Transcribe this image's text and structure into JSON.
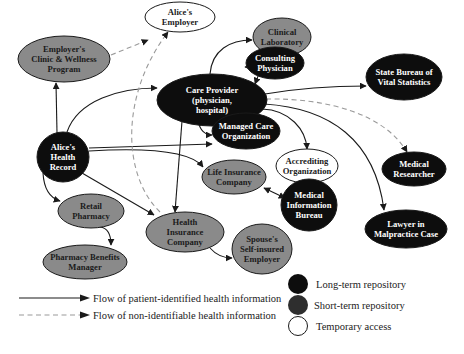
{
  "diagram": {
    "colors": {
      "long_term": "#0d0d0d",
      "short_term": "#8a8a8a",
      "legend_short_term": "#2e2e2e",
      "temporary": "#ffffff",
      "solid_edge": "#1a1a1a",
      "dashed_edge": "#9a9a9a"
    },
    "nodes": [
      {
        "id": "employers_clinic",
        "type": "short_term",
        "lines": [
          "Employer's",
          "Clinic & Wellness",
          "Program"
        ],
        "cx": 64,
        "cy": 59,
        "rx": 46,
        "ry": 23
      },
      {
        "id": "alices_employer",
        "type": "temporary",
        "lines": [
          "Alice's",
          "Employer"
        ],
        "cx": 180,
        "cy": 17,
        "rx": 35,
        "ry": 15
      },
      {
        "id": "clinical_laboratory",
        "type": "short_term",
        "lines": [
          "Clinical",
          "Laboratory"
        ],
        "cx": 282,
        "cy": 37,
        "rx": 29,
        "ry": 19
      },
      {
        "id": "care_provider",
        "type": "long_term",
        "lines": [
          "Care Provider",
          "(physician,",
          "hospital)"
        ],
        "cx": 212,
        "cy": 100,
        "rx": 55,
        "ry": 26
      },
      {
        "id": "consulting_physician",
        "type": "long_term",
        "lines": [
          "Consulting",
          "Physician"
        ],
        "cx": 275,
        "cy": 63,
        "rx": 29,
        "ry": 16
      },
      {
        "id": "state_bureau",
        "type": "long_term",
        "lines": [
          "State Bureau of",
          "Vital Statistics"
        ],
        "cx": 404,
        "cy": 77,
        "rx": 38,
        "ry": 23
      },
      {
        "id": "managed_care",
        "type": "long_term",
        "lines": [
          "Managed Care",
          "Organization"
        ],
        "cx": 246,
        "cy": 131,
        "rx": 34,
        "ry": 18
      },
      {
        "id": "alices_health_record",
        "type": "long_term",
        "lines": [
          "Alice's",
          "Health",
          "Record"
        ],
        "cx": 63,
        "cy": 157,
        "rx": 26,
        "ry": 25
      },
      {
        "id": "accrediting_org",
        "type": "temporary",
        "lines": [
          "Accrediting",
          "Organization"
        ],
        "cx": 307,
        "cy": 166,
        "rx": 31,
        "ry": 17
      },
      {
        "id": "medical_researcher",
        "type": "long_term",
        "lines": [
          "Medical",
          "Researcher"
        ],
        "cx": 414,
        "cy": 169,
        "rx": 32,
        "ry": 17
      },
      {
        "id": "life_insurance",
        "type": "short_term",
        "lines": [
          "Life Insurance",
          "Company"
        ],
        "cx": 234,
        "cy": 177,
        "rx": 32,
        "ry": 17
      },
      {
        "id": "medical_info_bureau",
        "type": "long_term",
        "lines": [
          "Medical",
          "Information",
          "Bureau"
        ],
        "cx": 309,
        "cy": 205,
        "rx": 28,
        "ry": 26
      },
      {
        "id": "lawyer",
        "type": "long_term",
        "lines": [
          "Lawyer in",
          "Malpractice Case"
        ],
        "cx": 406,
        "cy": 229,
        "rx": 41,
        "ry": 19
      },
      {
        "id": "retail_pharmacy",
        "type": "short_term",
        "lines": [
          "Retail",
          "Pharmacy"
        ],
        "cx": 91,
        "cy": 211,
        "rx": 33,
        "ry": 17
      },
      {
        "id": "health_insurance",
        "type": "short_term",
        "lines": [
          "Health",
          "Insurance",
          "Company"
        ],
        "cx": 185,
        "cy": 232,
        "rx": 39,
        "ry": 20
      },
      {
        "id": "pharmacy_benefits",
        "type": "short_term",
        "lines": [
          "Pharmacy Benefits",
          "Manager"
        ],
        "cx": 85,
        "cy": 262,
        "rx": 42,
        "ry": 17
      },
      {
        "id": "spouses_employer",
        "type": "short_term",
        "lines": [
          "Spouse's",
          "Self-insured",
          "Employer"
        ],
        "cx": 262,
        "cy": 249,
        "rx": 30,
        "ry": 25
      }
    ],
    "edges": [
      {
        "from": "alices_health_record",
        "to": "employers_clinic",
        "style": "solid",
        "d": "M 57 133 L 56 83"
      },
      {
        "from": "employers_clinic",
        "to": "alices_employer",
        "style": "dashed",
        "d": "M 111 55 L 148 40"
      },
      {
        "from": "alices_health_record",
        "to": "care_provider",
        "style": "solid",
        "d": "M 67 132 C 78 100, 120 88, 157 88"
      },
      {
        "from": "care_provider",
        "to": "clinical_laboratory",
        "style": "solid",
        "d": "M 210 74 C 212 50, 230 40, 252 40"
      },
      {
        "from": "care_provider",
        "to": "consulting_physician",
        "style": "both",
        "d": "M 255 84 C 260 70, 265 67, 245 67"
      },
      {
        "from": "care_provider",
        "to": "state_bureau",
        "style": "solid",
        "d": "M 265 94 C 300 88, 340 86, 366 86"
      },
      {
        "from": "care_provider",
        "to": "managed_care",
        "style": "both",
        "d": "M 197 113 C 198 130, 205 135, 212 135"
      },
      {
        "from": "alices_health_record",
        "to": "managed_care",
        "style": "solid",
        "d": "M 89 148 L 212 144"
      },
      {
        "from": "alices_health_record",
        "to": "life_insurance",
        "style": "solid",
        "d": "M 89 151 C 140 148, 190 150, 203 167"
      },
      {
        "from": "care_provider",
        "to": "accrediting_org",
        "style": "solid",
        "d": "M 262 109 C 290 110, 306 130, 307 149"
      },
      {
        "from": "care_provider",
        "to": "medical_researcher",
        "style": "dashed",
        "d": "M 266 99 C 330 98, 385 115, 407 152"
      },
      {
        "from": "care_provider",
        "to": "lawyer",
        "style": "solid",
        "d": "M 264 104 C 330 108, 375 140, 384 210"
      },
      {
        "from": "care_provider",
        "to": "health_insurance",
        "style": "solid",
        "d": "M 182 121 L 175 212"
      },
      {
        "from": "health_insurance",
        "to": "alices_employer",
        "style": "dashed",
        "d": "M 160 212 C 122 175, 120 95, 168 32"
      },
      {
        "from": "alices_health_record",
        "to": "retail_pharmacy",
        "style": "solid",
        "d": "M 43 173 C 44 190, 50 198, 60 201"
      },
      {
        "from": "alices_health_record",
        "to": "health_insurance",
        "style": "solid",
        "d": "M 82 173 L 154 215"
      },
      {
        "from": "retail_pharmacy",
        "to": "pharmacy_benefits",
        "style": "solid",
        "d": "M 100 227 C 108 228, 111 235, 111 245"
      },
      {
        "from": "life_insurance",
        "to": "medical_info_bureau",
        "style": "both",
        "d": "M 264 188 L 285 198"
      },
      {
        "from": "health_insurance",
        "to": "spouses_employer",
        "style": "solid",
        "d": "M 210 248 C 217 256, 225 258, 232 258"
      }
    ],
    "legend": {
      "nodes": [
        {
          "type": "long_term",
          "label": "Long-term repository"
        },
        {
          "type": "short_term",
          "label": "Short-term repository"
        },
        {
          "type": "temporary",
          "label": "Temporary access"
        }
      ],
      "edges": [
        {
          "style": "solid",
          "label": "Flow of patient-identified health information"
        },
        {
          "style": "dashed",
          "label": "Flow of non-identifiable health information"
        }
      ]
    }
  }
}
